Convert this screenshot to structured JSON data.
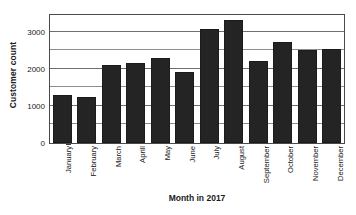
{
  "chart_data": {
    "type": "bar",
    "title": "",
    "xlabel": "Month in 2017",
    "ylabel": "Customer count",
    "categories": [
      "January",
      "February",
      "March",
      "Aprill",
      "May",
      "June",
      "July",
      "August",
      "September",
      "October",
      "November",
      "December"
    ],
    "values": [
      1300,
      1250,
      2100,
      2150,
      2300,
      1900,
      3080,
      3300,
      2200,
      2720,
      2500,
      2520
    ],
    "ylim": [
      0,
      3500
    ],
    "ytick_labels": [
      "0",
      "1000",
      "2000",
      "3000"
    ],
    "ytick_values": [
      0,
      1000,
      2000,
      3000
    ],
    "gridline_values": [
      500,
      1000,
      1500,
      2000,
      2500,
      3000
    ],
    "grid": true,
    "legend": "none",
    "bar_color": "#242424",
    "grid_color": "#8d8d8d",
    "frame_color": "#4a4a4a"
  }
}
